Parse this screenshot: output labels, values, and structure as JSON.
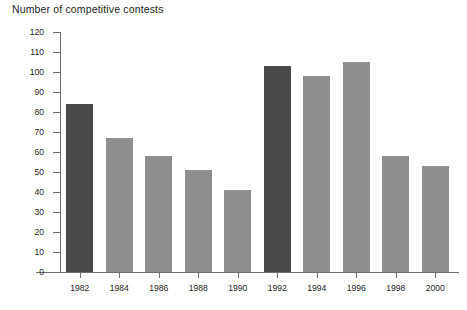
{
  "chart_data": {
    "type": "bar",
    "title": "Number of competitive contests",
    "xlabel": "",
    "ylabel": "",
    "categories": [
      "1982",
      "1984",
      "1986",
      "1988",
      "1990",
      "1992",
      "1994",
      "1996",
      "1998",
      "2000"
    ],
    "values": [
      84,
      67,
      58,
      51,
      41,
      103,
      98,
      105,
      58,
      53
    ],
    "bar_colors": [
      "#4a4a4a",
      "#8e8e8e",
      "#8e8e8e",
      "#8e8e8e",
      "#8e8e8e",
      "#4a4a4a",
      "#8e8e8e",
      "#8e8e8e",
      "#8e8e8e",
      "#8e8e8e"
    ],
    "ylim": [
      0,
      120
    ],
    "ytick_values": [
      0,
      10,
      20,
      30,
      40,
      50,
      60,
      70,
      80,
      90,
      100,
      110,
      120
    ],
    "ytick_labels": [
      "0",
      "10",
      "20",
      "30",
      "40",
      "50",
      "60",
      "70",
      "80",
      "90",
      "100",
      "110",
      "120"
    ],
    "grid": false,
    "legend": null,
    "axis_color": "#6d6e71",
    "text_color": "#231f20",
    "background": "#ffffff"
  }
}
